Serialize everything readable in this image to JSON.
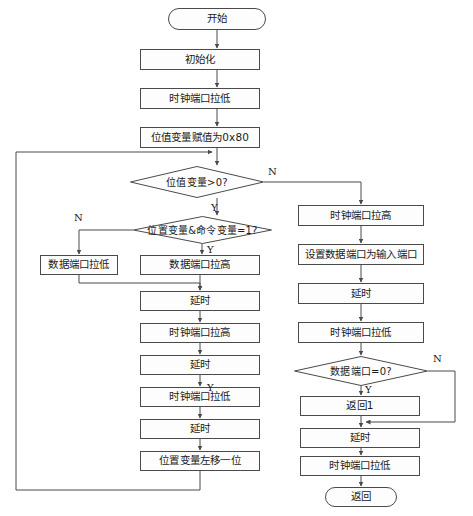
{
  "diagram": {
    "stroke_color": "#4a4a4a",
    "text_color": "#1b1b1b",
    "background": "#ffffff",
    "nodes": [
      {
        "id": "start",
        "type": "terminator",
        "label": "开始",
        "x": 168,
        "y": 8,
        "w": 98,
        "h": 22
      },
      {
        "id": "init",
        "type": "process",
        "label": "初始化",
        "x": 140,
        "y": 49,
        "w": 120,
        "h": 21
      },
      {
        "id": "clk_low_1",
        "type": "process",
        "label": "时钟端口拉低",
        "x": 140,
        "y": 88,
        "w": 120,
        "h": 21
      },
      {
        "id": "bitvar_set",
        "type": "process",
        "label": "位值变量赋值为0x80",
        "x": 140,
        "y": 127,
        "w": 120,
        "h": 21
      },
      {
        "id": "dec_bitvar",
        "type": "decision",
        "label": "位值变量>0?",
        "x": 130,
        "y": 166,
        "w": 134,
        "h": 32
      },
      {
        "id": "dec_andcmd",
        "type": "decision",
        "label": "位置变量&命令变量=1?",
        "x": 133,
        "y": 216,
        "w": 139,
        "h": 28
      },
      {
        "id": "data_low",
        "type": "process",
        "label": "数据端口拉低",
        "x": 40,
        "y": 255,
        "w": 78,
        "h": 20
      },
      {
        "id": "data_high",
        "type": "process",
        "label": "数据端口拉高",
        "x": 140,
        "y": 255,
        "w": 120,
        "h": 20
      },
      {
        "id": "delay_1",
        "type": "process",
        "label": "延时",
        "x": 140,
        "y": 291,
        "w": 120,
        "h": 20
      },
      {
        "id": "clk_high_2",
        "type": "process",
        "label": "时钟端口拉高",
        "x": 140,
        "y": 323,
        "w": 120,
        "h": 20
      },
      {
        "id": "delay_2",
        "type": "process",
        "label": "延时",
        "x": 140,
        "y": 355,
        "w": 120,
        "h": 20
      },
      {
        "id": "clk_low_2",
        "type": "process",
        "label": "时钟端口拉低",
        "x": 140,
        "y": 387,
        "w": 120,
        "h": 20
      },
      {
        "id": "delay_3",
        "type": "process",
        "label": "延时",
        "x": 140,
        "y": 419,
        "w": 120,
        "h": 20
      },
      {
        "id": "shift_left",
        "type": "process",
        "label": "位置变量左移一位",
        "x": 140,
        "y": 451,
        "w": 120,
        "h": 20
      },
      {
        "id": "clk_high_r",
        "type": "process",
        "label": "时钟端口拉高",
        "x": 298,
        "y": 205,
        "w": 126,
        "h": 21
      },
      {
        "id": "set_input",
        "type": "process",
        "label": "设置数据端口为输入端口",
        "x": 298,
        "y": 244,
        "w": 126,
        "h": 21
      },
      {
        "id": "delay_r1",
        "type": "process",
        "label": "延时",
        "x": 298,
        "y": 283,
        "w": 126,
        "h": 21
      },
      {
        "id": "clk_low_r",
        "type": "process",
        "label": "时钟端口拉低",
        "x": 298,
        "y": 322,
        "w": 126,
        "h": 21
      },
      {
        "id": "dec_dataport",
        "type": "decision",
        "label": "数据端口=0?",
        "x": 294,
        "y": 356,
        "w": 134,
        "h": 30
      },
      {
        "id": "return1",
        "type": "process",
        "label": "返回1",
        "x": 300,
        "y": 396,
        "w": 120,
        "h": 20
      },
      {
        "id": "delay_r2",
        "type": "process",
        "label": "延时",
        "x": 300,
        "y": 428,
        "w": 120,
        "h": 20
      },
      {
        "id": "clk_low_r2",
        "type": "process",
        "label": "时钟端口拉低",
        "x": 300,
        "y": 456,
        "w": 120,
        "h": 20
      },
      {
        "id": "return_end",
        "type": "terminator",
        "label": "返回",
        "x": 325,
        "y": 487,
        "w": 72,
        "h": 20
      }
    ],
    "edge_labels": [
      {
        "id": "lbl-n-bitvar",
        "text": "N",
        "x": 268,
        "y": 166
      },
      {
        "id": "lbl-y-bitvar",
        "text": "Y",
        "x": 211,
        "y": 202
      },
      {
        "id": "lbl-n-andcmd",
        "text": "N",
        "x": 74,
        "y": 212
      },
      {
        "id": "lbl-y-andcmd",
        "text": "Y",
        "x": 207,
        "y": 244
      },
      {
        "id": "lbl-n-dataport",
        "text": "N",
        "x": 433,
        "y": 353
      },
      {
        "id": "lbl-y-dataport",
        "text": "Y",
        "x": 207,
        "y": 382
      },
      {
        "id": "lbl-y-dataport2",
        "text": "Y",
        "x": 365,
        "y": 384
      }
    ]
  }
}
